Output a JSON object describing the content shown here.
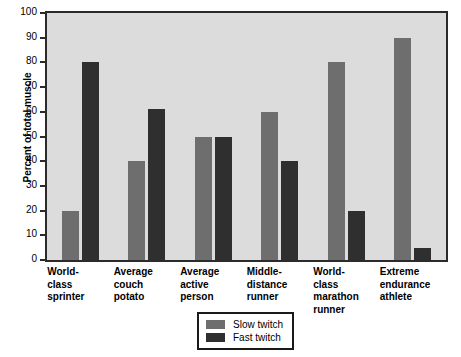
{
  "chart_data": {
    "type": "bar",
    "title": "",
    "xlabel": "",
    "ylabel": "Percent of total muscle",
    "ylim": [
      0,
      100
    ],
    "ytick_values": [
      0,
      10,
      20,
      30,
      40,
      50,
      60,
      70,
      80,
      90,
      100
    ],
    "ytick_labels": [
      "0",
      "10",
      "20",
      "30",
      "40",
      "50",
      "60",
      "70",
      "80",
      "90",
      "100"
    ],
    "grid": false,
    "legend_position": "bottom-center",
    "categories": [
      "World-\nclass\nsprinter",
      "Average\ncouch\npotato",
      "Average\nactive\nperson",
      "Middle-\ndistance\nrunner",
      "World-\nclass\nmarathon\nrunner",
      "Extreme\nendurance\nathlete"
    ],
    "series": [
      {
        "name": "Slow twitch",
        "color": "#6e6e6e",
        "values": [
          20,
          40,
          50,
          60,
          80,
          90
        ]
      },
      {
        "name": "Fast twitch",
        "color": "#2f2f2f",
        "values": [
          80,
          61,
          50,
          40,
          20,
          5
        ]
      }
    ]
  },
  "legend": {
    "entries": [
      {
        "label": "Slow twitch"
      },
      {
        "label": "Fast twitch"
      }
    ]
  },
  "colors": {
    "plot_background": "#dcdcdc",
    "axis": "#2b2b2b",
    "slow_twitch": "#6e6e6e",
    "fast_twitch": "#2f2f2f",
    "page_background": "#ffffff"
  }
}
